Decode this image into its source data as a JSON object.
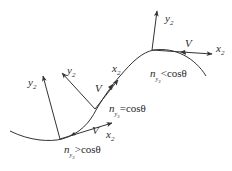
{
  "diagram": {
    "type": "trajectory-frames",
    "stroke_color": "#333333",
    "points": [
      {
        "id": "bottom",
        "condition_var": "n",
        "condition_sub": "y",
        "condition_sub2": "2",
        "condition_rel": ">cosθ",
        "v_label": "V",
        "x_label": "x",
        "x_sub": "2",
        "y_label": "y",
        "y_sub": "2"
      },
      {
        "id": "middle",
        "condition_var": "n",
        "condition_sub": "y",
        "condition_sub2": "2",
        "condition_rel": "=cosθ",
        "v_label": "V",
        "x_label": "x",
        "x_sub": "2",
        "y_label": "y",
        "y_sub": "2"
      },
      {
        "id": "top",
        "condition_var": "n",
        "condition_sub": "y",
        "condition_sub2": "2",
        "condition_rel": "<cosθ",
        "v_label": "V",
        "x_label": "x",
        "x_sub": "2",
        "y_label": "y",
        "y_sub": "2"
      }
    ]
  }
}
